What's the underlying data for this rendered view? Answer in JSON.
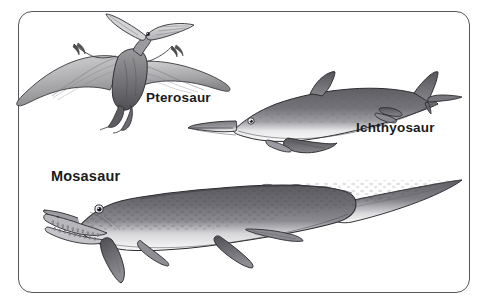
{
  "figure": {
    "background_color": "#ffffff",
    "frame": {
      "name": "rounded-rectangle-border",
      "stroke_color": "#55555c",
      "corner_radius_px": 14
    },
    "style": "grayscale pen-and-ink / pencil shaded scientific illustration",
    "creatures": [
      {
        "id": "pterosaur",
        "label": "Pterosaur",
        "description": "Pteranodon-like flying reptile with broad outstretched wings, long toothless beak and a long backward-pointing head crest, seen in flight from the front-left",
        "position": "upper-left",
        "label_position": "right of body, below the wings"
      },
      {
        "id": "ichthyosaur",
        "label": "Ichthyosaur",
        "description": "Dolphin-shaped marine reptile with long pointed snout, large round eye, triangular dorsal fin, paired flippers and a crescent-shaped vertical tail fin; dark gray back with pale white underside, facing left",
        "position": "upper-right",
        "label_position": "below and right of the body"
      },
      {
        "id": "mosasaur",
        "label": "Mosasaur",
        "description": "Long-bodied marine lizard with a crocodile-like head full of conical teeth, round eye, four paddle-shaped flippers and a very long tapering tail; dark mottled gray back with pale belly, facing left",
        "position": "lower half, spanning the full width",
        "label_position": "above the head at upper-left"
      }
    ]
  },
  "labels": {
    "pterosaur": "Pterosaur",
    "ichthyosaur": "Ichthyosaur",
    "mosasaur": "Mosasaur"
  },
  "colors": {
    "border": "#55555c",
    "label_text": "#1b1b1b",
    "background": "#ffffff",
    "ink_outline": "#2a2a2a",
    "body_dark": "#6b6b6e",
    "body_mid": "#8e8e91",
    "body_light": "#c9c9cb",
    "belly": "#f2f2f2",
    "wing_membrane": "#b4b4b7"
  }
}
